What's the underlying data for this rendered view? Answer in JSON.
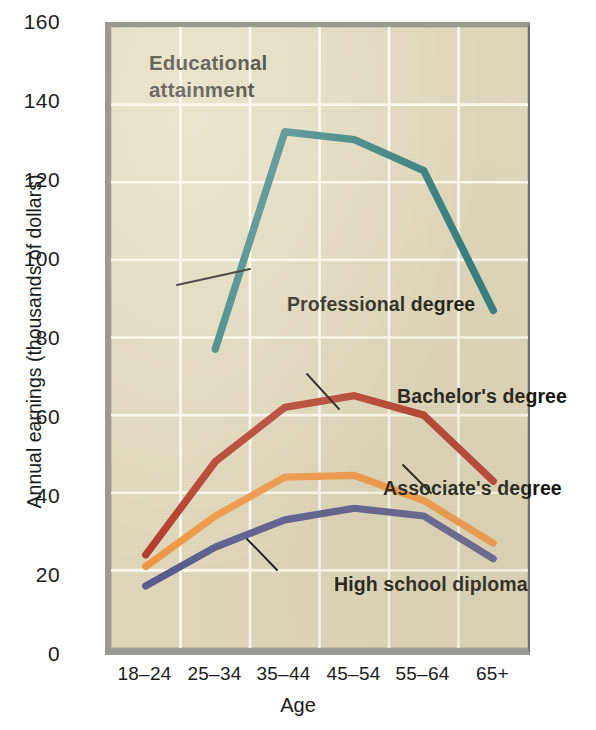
{
  "figure": {
    "background_color": "#ffffff",
    "plot_background_color": "#e3dcc0",
    "gridline_color": "#fbf8ee",
    "frame_color": "#9b9a92"
  },
  "plot_title": "Educational\nattainment",
  "plot_title_line1": "Educational",
  "plot_title_line2": "attainment",
  "axes": {
    "x_title": "Age",
    "y_title": "Annual earnings (thousands of dollars)",
    "x_categories": [
      "18–24",
      "25–34",
      "35–44",
      "45–54",
      "55–64",
      "65+"
    ],
    "y_ticks": [
      "160",
      "140",
      "120",
      "100",
      "80",
      "60",
      "40",
      "20",
      "0"
    ]
  },
  "series_labels": {
    "professional": "Professional degree",
    "bachelors": "Bachelor's degree",
    "associates": "Associate's degree",
    "highschool": "High school diploma"
  },
  "chart_data": {
    "type": "line",
    "title": "Educational attainment",
    "xlabel": "Age",
    "ylabel": "Annual earnings (thousands of dollars)",
    "categories": [
      "18–24",
      "25–34",
      "35–44",
      "45–54",
      "55–64",
      "65+"
    ],
    "ylim": [
      0,
      160
    ],
    "ytick_step": 20,
    "grid": true,
    "legend": "inline-annotations",
    "series": [
      {
        "name": "Professional degree",
        "color": "#2d7a7b",
        "values": [
          null,
          77,
          133,
          131,
          123,
          87
        ]
      },
      {
        "name": "Bachelor's degree",
        "color": "#b33a2b",
        "values": [
          24,
          48,
          62,
          65,
          60,
          43
        ]
      },
      {
        "name": "Associate's degree",
        "color": "#ef9543",
        "values": [
          21,
          34,
          44,
          44.5,
          38,
          27
        ]
      },
      {
        "name": "High school diploma",
        "color": "#5a5a8e",
        "values": [
          16,
          26,
          33,
          36,
          34,
          23
        ]
      }
    ]
  }
}
